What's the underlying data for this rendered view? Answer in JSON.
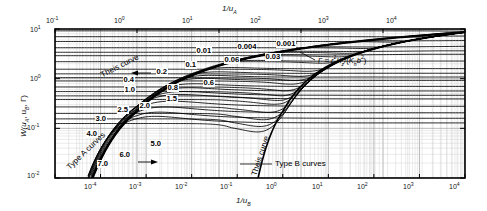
{
  "figure": {
    "kind": "neuman-type-curves",
    "background": "#ffffff",
    "frame_color": "#000000",
    "grid_color": "#b9b9b9",
    "curve_color": "#000000"
  },
  "axes": {
    "top": {
      "title": "1/u",
      "title_sub": "A",
      "ticks": [
        "10⁻¹",
        "10⁰",
        "10¹",
        "10²",
        "10³",
        "10⁴"
      ],
      "tick_mantissas": [
        "10",
        "10",
        "10",
        "10",
        "10",
        "10"
      ],
      "tick_exponents": [
        "-1",
        "0",
        "1",
        "2",
        "3",
        "4"
      ],
      "range": [
        -1,
        4
      ]
    },
    "bottom": {
      "title": "1/u",
      "title_sub": "B",
      "ticks": [
        "10⁻⁵",
        "10⁻⁴",
        "10⁻³",
        "10⁻²",
        "10⁻¹",
        "10⁰",
        "10¹",
        "10²",
        "10³",
        "10⁴"
      ],
      "tick_mantissas": [
        "10",
        "10",
        "10",
        "10",
        "10",
        "10",
        "10",
        "10",
        "10",
        "10"
      ],
      "tick_exponents": [
        "-5",
        "-4",
        "-3",
        "-2",
        "-1",
        "0",
        "1",
        "2",
        "3",
        "4"
      ],
      "labelled_exponents": [
        "-4",
        "-3",
        "-2",
        "-1",
        "0",
        "1",
        "2",
        "3",
        "4"
      ],
      "range": [
        -5,
        4
      ]
    },
    "left": {
      "title": "W(u",
      "title_sub_a": "A",
      "title_mid": ", u",
      "title_sub_b": "B",
      "title_end": ", Γ)",
      "title_full": "W(uA, uB, Γ)",
      "ticks": [
        "10¹",
        "10⁰",
        "10⁻¹",
        "10⁻²"
      ],
      "tick_mantissas": [
        "10",
        "10",
        "10",
        "10"
      ],
      "tick_exponents": [
        "1",
        "0",
        "-1",
        "-2"
      ],
      "range": [
        -2,
        1
      ]
    }
  },
  "annotations": {
    "type_a_label": "Type A curves",
    "type_b_label": "Type B curves",
    "theis_top_label": "Theis curve",
    "theis_bottom_label": "Theis curve",
    "gamma_definition": "Γ = r²Kz /(Kh b²)",
    "gamma_symbol": "Γ",
    "gamma_equals": " = ",
    "gamma_r": "r",
    "gamma_r_sup": "2",
    "gamma_kz": "K",
    "gamma_kz_sub": "z",
    "gamma_slash": "/(",
    "gamma_kh": "K",
    "gamma_kh_sub": "h",
    "gamma_b": "b",
    "gamma_b_sup": "2",
    "gamma_close": ")"
  },
  "chart_data": {
    "type": "line",
    "title": "",
    "subtitle": "",
    "xlabel_top": "1/uA",
    "xlabel_bottom": "1/uB",
    "ylabel": "W(uA, uB, Γ)",
    "grid": true,
    "log_x": true,
    "log_y": true,
    "xlim_top": [
      0.1,
      10000
    ],
    "xlim_bottom": [
      1e-05,
      10000
    ],
    "ylim": [
      0.01,
      10
    ],
    "legend": "none",
    "legend_position": "none",
    "gamma_parameter": "Γ = r²Kz/(Kh b²)",
    "curve_label_values": [
      0.001,
      0.004,
      0.01,
      0.03,
      0.06,
      0.1,
      0.2,
      0.4,
      0.6,
      0.8,
      1.0,
      1.5,
      2.0,
      2.5,
      3.0,
      4.0,
      5.0,
      6.0,
      7.0
    ],
    "type_a_gamma_labels": [
      0.001,
      0.004,
      0.01,
      0.03,
      0.06,
      0.1,
      0.2,
      0.4,
      0.6,
      0.8,
      1.0,
      1.5,
      2.0,
      2.5,
      3.0,
      4.0,
      5.0,
      6.0,
      7.0
    ],
    "type_b_gamma_labels": [
      0.001,
      0.004,
      0.01,
      0.03,
      0.06,
      0.1,
      0.2,
      0.4,
      0.6,
      0.8,
      1.0,
      1.5,
      2.0,
      2.5,
      3.0,
      4.0,
      5.0,
      6.0,
      7.0
    ],
    "series": [
      {
        "name": "Theis curve (Type A asymptote)",
        "role": "theis-upper"
      },
      {
        "name": "Theis curve (Type B asymptote)",
        "role": "theis-lower"
      },
      {
        "name": "Γ = 0.001",
        "gamma": 0.001,
        "plateau_W": 9.2
      },
      {
        "name": "Γ = 0.004",
        "gamma": 0.004,
        "plateau_W": 7.0
      },
      {
        "name": "Γ = 0.01",
        "gamma": 0.01,
        "plateau_W": 5.6
      },
      {
        "name": "Γ = 0.03",
        "gamma": 0.03,
        "plateau_W": 4.2
      },
      {
        "name": "Γ = 0.06",
        "gamma": 0.06,
        "plateau_W": 3.4
      },
      {
        "name": "Γ = 0.1",
        "gamma": 0.1,
        "plateau_W": 2.9
      },
      {
        "name": "Γ = 0.2",
        "gamma": 0.2,
        "plateau_W": 2.2
      },
      {
        "name": "Γ = 0.4",
        "gamma": 0.4,
        "plateau_W": 1.55
      },
      {
        "name": "Γ = 0.6",
        "gamma": 0.6,
        "plateau_W": 1.25
      },
      {
        "name": "Γ = 0.8",
        "gamma": 0.8,
        "plateau_W": 1.05
      },
      {
        "name": "Γ = 1.0",
        "gamma": 1.0,
        "plateau_W": 0.9
      },
      {
        "name": "Γ = 1.5",
        "gamma": 1.5,
        "plateau_W": 0.68
      },
      {
        "name": "Γ = 2.0",
        "gamma": 2.0,
        "plateau_W": 0.55
      },
      {
        "name": "Γ = 2.5",
        "gamma": 2.5,
        "plateau_W": 0.45
      },
      {
        "name": "Γ = 3.0",
        "gamma": 3.0,
        "plateau_W": 0.38
      },
      {
        "name": "Γ = 4.0",
        "gamma": 4.0,
        "plateau_W": 0.27
      },
      {
        "name": "Γ = 5.0",
        "gamma": 5.0,
        "plateau_W": 0.2
      },
      {
        "name": "Γ = 6.0",
        "gamma": 6.0,
        "plateau_W": 0.155
      },
      {
        "name": "Γ = 7.0",
        "gamma": 7.0,
        "plateau_W": 0.125
      }
    ]
  },
  "curve_labels": [
    {
      "text": "0.001",
      "x": 276,
      "y": 40
    },
    {
      "text": "0.004",
      "x": 237,
      "y": 43
    },
    {
      "text": "0.01",
      "x": 196,
      "y": 47
    },
    {
      "text": "0.03",
      "x": 265,
      "y": 53
    },
    {
      "text": "0.06",
      "x": 224,
      "y": 56
    },
    {
      "text": "0.1",
      "x": 185,
      "y": 61
    },
    {
      "text": "0.2",
      "x": 156,
      "y": 68
    },
    {
      "text": "0.4",
      "x": 123,
      "y": 76
    },
    {
      "text": "0.6",
      "x": 203,
      "y": 79
    },
    {
      "text": "0.8",
      "x": 167,
      "y": 84
    },
    {
      "text": "1.0",
      "x": 124,
      "y": 86
    },
    {
      "text": "1.5",
      "x": 166,
      "y": 95
    },
    {
      "text": "2.0",
      "x": 139,
      "y": 102
    },
    {
      "text": "2.5",
      "x": 117,
      "y": 106
    },
    {
      "text": "3.0",
      "x": 95,
      "y": 115
    },
    {
      "text": "4.0",
      "x": 86,
      "y": 130
    },
    {
      "text": "5.0",
      "x": 150,
      "y": 140
    },
    {
      "text": "6.0",
      "x": 119,
      "y": 151
    },
    {
      "text": "7.0",
      "x": 97,
      "y": 160
    }
  ]
}
